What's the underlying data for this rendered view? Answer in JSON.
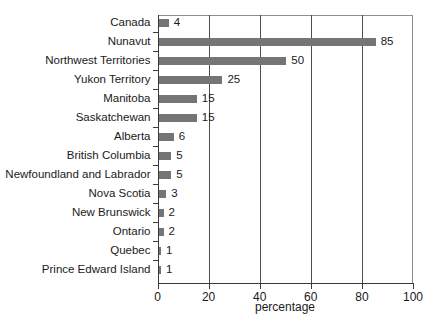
{
  "chart_data": {
    "type": "bar",
    "orientation": "horizontal",
    "title": "",
    "xlabel": "percentage",
    "ylabel": "",
    "xlim": [
      0,
      100
    ],
    "xticks": [
      0,
      20,
      40,
      60,
      80,
      100
    ],
    "xtick_labels": [
      "0",
      "20",
      "40",
      "60",
      "80",
      "100"
    ],
    "grid": "vertical gridlines at each x tick, boxed plot area",
    "legend": "none",
    "categories": [
      "Canada",
      "Nunavut",
      "Northwest Territories",
      "Yukon Territory",
      "Manitoba",
      "Saskatchewan",
      "Alberta",
      "British Columbia",
      "Newfoundland and Labrador",
      "Nova Scotia",
      "New Brunswick",
      "Ontario",
      "Quebec",
      "Prince Edward Island"
    ],
    "values": [
      4,
      85,
      50,
      25,
      15,
      15,
      6,
      5,
      5,
      3,
      2,
      2,
      1,
      1
    ],
    "value_labels": [
      "4",
      "85",
      "50",
      "25",
      "15",
      "15",
      "6",
      "5",
      "5",
      "3",
      "2",
      "2",
      "1",
      "1"
    ],
    "bar_color": "#757575",
    "text_color": "#1a1a1a",
    "axis_color": "#3a3a3a",
    "grid_color": "#4d4d4d",
    "border_color": "#8f8f8f",
    "background": "#ffffff"
  }
}
